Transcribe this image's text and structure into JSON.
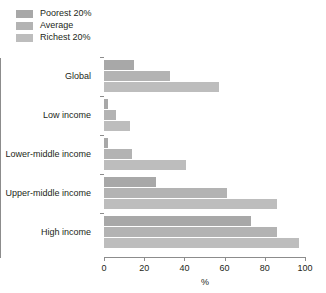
{
  "chart_data": {
    "type": "bar",
    "orientation": "horizontal",
    "title": "",
    "xlabel": "%",
    "ylabel": "",
    "xlim": [
      0,
      100
    ],
    "xticks": [
      0,
      20,
      40,
      60,
      80,
      100
    ],
    "grid": false,
    "legend_position": "top-left",
    "categories": [
      "Global",
      "Low income",
      "Lower-middle income",
      "Upper-middle income",
      "High income"
    ],
    "series": [
      {
        "name": "Poorest 20%",
        "color": "#a8a8a8",
        "values": [
          15,
          2,
          2,
          26,
          73
        ]
      },
      {
        "name": "Average",
        "color": "#b3b3b3",
        "values": [
          33,
          6,
          14,
          61,
          86
        ]
      },
      {
        "name": "Richest 20%",
        "color": "#bdbdbd",
        "values": [
          57,
          13,
          41,
          86,
          97
        ]
      }
    ]
  },
  "axis": {
    "x_title": "%",
    "tick_labels": [
      "0",
      "20",
      "40",
      "60",
      "80",
      "100"
    ]
  },
  "legend": {
    "items": [
      {
        "label": "Poorest 20%",
        "color": "#a8a8a8"
      },
      {
        "label": "Average",
        "color": "#b3b3b3"
      },
      {
        "label": "Richest 20%",
        "color": "#bdbdbd"
      }
    ]
  }
}
